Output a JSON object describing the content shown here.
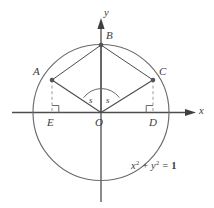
{
  "figure": {
    "type": "geometry-diagram",
    "equation_label": {
      "x_var": "x",
      "y_var": "y",
      "exponent": "2",
      "plus": "+",
      "equals": "=",
      "value": "1",
      "full_text": "x² + y² = 1"
    },
    "axes": {
      "x_label": "x",
      "y_label": "y",
      "origin_label": "O"
    },
    "points": [
      {
        "id": "A",
        "label": "A",
        "x": 52,
        "y": 80
      },
      {
        "id": "B",
        "label": "B",
        "x": 101,
        "y": 45
      },
      {
        "id": "C",
        "label": "C",
        "x": 153,
        "y": 80
      },
      {
        "id": "D",
        "label": "D",
        "x": 153,
        "y": 113
      },
      {
        "id": "E",
        "label": "E",
        "x": 52,
        "y": 113
      },
      {
        "id": "O",
        "label": "O",
        "x": 101,
        "y": 113
      }
    ],
    "angles": [
      {
        "id": "angle-left",
        "label": "s"
      },
      {
        "id": "angle-right",
        "label": "s"
      }
    ],
    "colors": {
      "stroke": "#4d4d4d",
      "circle": "#5a5a5a",
      "dashed": "#8c8c8c",
      "text": "#3a3a3a",
      "background": "#ffffff",
      "point_fill": "#555555"
    },
    "geometry": {
      "center_x": 101,
      "center_y": 112.5,
      "radius": 68
    }
  }
}
